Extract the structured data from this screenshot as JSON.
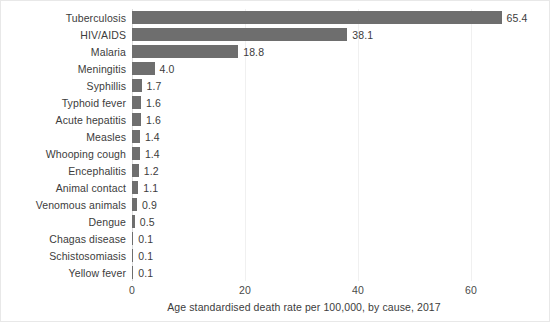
{
  "chart_data": {
    "type": "bar",
    "orientation": "horizontal",
    "title": "",
    "subtitle": "",
    "xlabel": "Age standardised death rate per 100,000, by cause, 2017",
    "ylabel": "",
    "xlim": [
      0,
      72.2
    ],
    "xticks": [
      0,
      20,
      40,
      60
    ],
    "xtick_labels": [
      "0",
      "20",
      "40",
      "60"
    ],
    "grid": "vertical-light",
    "legend": null,
    "bar_color": "#6e6e6e",
    "categories": [
      "Tuberculosis",
      "HIV/AIDS",
      "Malaria",
      "Meningitis",
      "Syphillis",
      "Typhoid fever",
      "Acute hepatitis",
      "Measles",
      "Whooping cough",
      "Encephalitis",
      "Animal contact",
      "Venomous animals",
      "Dengue",
      "Chagas disease",
      "Schistosomiasis",
      "Yellow fever"
    ],
    "values": [
      65.4,
      38.1,
      18.8,
      4.0,
      1.7,
      1.6,
      1.6,
      1.4,
      1.4,
      1.2,
      1.1,
      0.9,
      0.5,
      0.1,
      0.1,
      0.1
    ],
    "value_labels": [
      "65.4",
      "38.1",
      "18.8",
      "4.0",
      "1.7",
      "1.6",
      "1.6",
      "1.4",
      "1.4",
      "1.2",
      "1.1",
      "0.9",
      "0.5",
      "0.1",
      "0.1",
      "0.1"
    ]
  }
}
